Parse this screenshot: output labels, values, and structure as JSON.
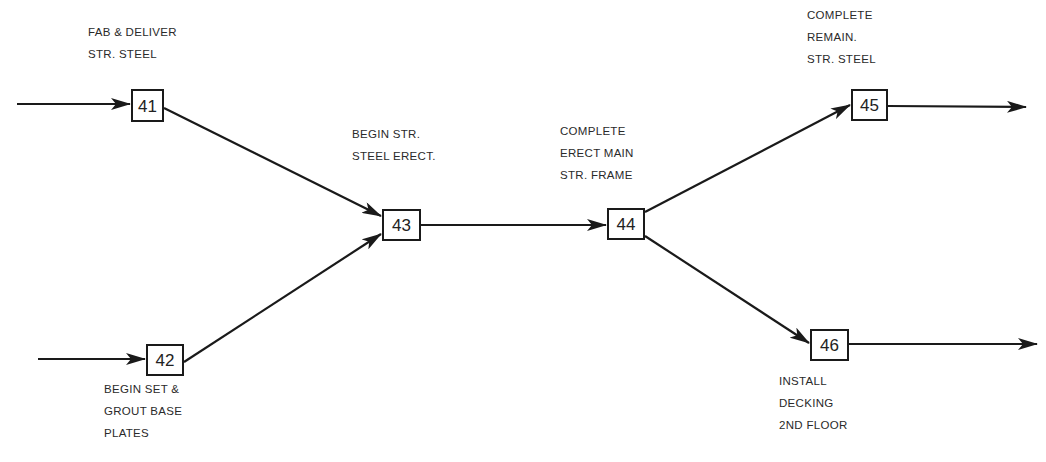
{
  "diagram": {
    "type": "activity-on-node network (precedence diagram)",
    "nodes": [
      {
        "id": "41",
        "label_lines": [
          "FAB & DELIVER",
          "STR. STEEL"
        ]
      },
      {
        "id": "42",
        "label_lines": [
          "BEGIN SET &",
          "GROUT BASE",
          "PLATES"
        ]
      },
      {
        "id": "43",
        "label_lines": [
          "BEGIN STR.",
          "STEEL ERECT."
        ]
      },
      {
        "id": "44",
        "label_lines": [
          "COMPLETE",
          "ERECT MAIN",
          "STR. FRAME"
        ]
      },
      {
        "id": "45",
        "label_lines": [
          "COMPLETE",
          "REMAIN.",
          "STR. STEEL"
        ]
      },
      {
        "id": "46",
        "label_lines": [
          "INSTALL",
          "DECKING",
          "2ND FLOOR"
        ]
      }
    ],
    "edges": [
      {
        "from": "(in)",
        "to": "41"
      },
      {
        "from": "(in)",
        "to": "42"
      },
      {
        "from": "41",
        "to": "43"
      },
      {
        "from": "42",
        "to": "43"
      },
      {
        "from": "43",
        "to": "44"
      },
      {
        "from": "44",
        "to": "45"
      },
      {
        "from": "44",
        "to": "46"
      },
      {
        "from": "45",
        "to": "(out)"
      },
      {
        "from": "46",
        "to": "(out)"
      }
    ],
    "colors": {
      "line": "#1a1a1a",
      "text": "#2a2a2a",
      "background": "#ffffff"
    }
  }
}
